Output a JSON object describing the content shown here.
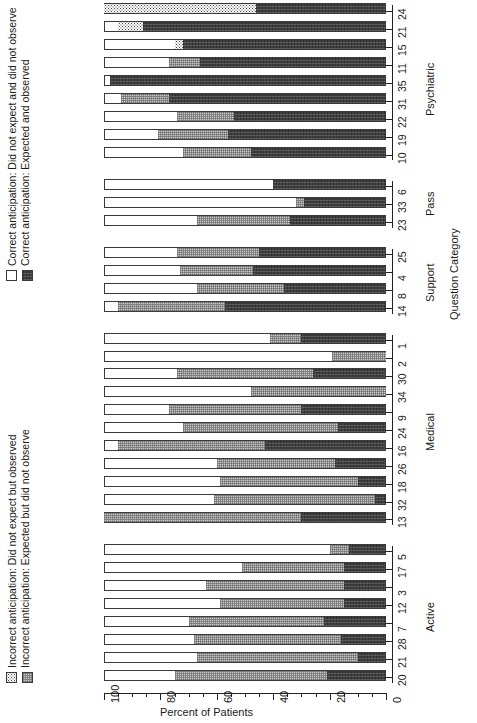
{
  "chart_data": {
    "type": "bar",
    "orientation": "stacked-horizontal-rotated",
    "title": "",
    "xlabel": "Question Category",
    "ylabel": "Percent of Patients",
    "ylim": [
      0,
      100
    ],
    "ytick_labels": [
      "0",
      "20",
      "40",
      "60",
      "80",
      "100"
    ],
    "ytick_values": [
      0,
      20,
      40,
      60,
      80,
      100
    ],
    "grid": false,
    "legend_position": "left",
    "series": [
      {
        "name": "Correct anticipation: Did not expect and did not observe",
        "key": "cdnd",
        "pattern": "open-white"
      },
      {
        "name": "Correct anticipation: Expected and observed",
        "key": "ceo",
        "pattern": "solid-dark"
      },
      {
        "name": "Incorrect anticipation: Did not expect but observed",
        "key": "indo",
        "pattern": "speckled"
      },
      {
        "name": "Incorrect anticipation: Expected but did not observe",
        "key": "iedn",
        "pattern": "gray-hatch"
      }
    ],
    "groups": [
      {
        "name": "Active",
        "questions": [
          {
            "q": "20",
            "cdnd": 25.0,
            "iedn": 54.0,
            "ceo": 21.0,
            "indo": 0.0
          },
          {
            "q": "21",
            "cdnd": 33.0,
            "iedn": 57.0,
            "ceo": 10.0,
            "indo": 0.0
          },
          {
            "q": "28",
            "cdnd": 32.0,
            "iedn": 52.0,
            "ceo": 16.0,
            "indo": 0.0
          },
          {
            "q": "7",
            "cdnd": 30.0,
            "iedn": 48.0,
            "ceo": 22.0,
            "indo": 0.0
          },
          {
            "q": "12",
            "cdnd": 41.0,
            "iedn": 44.0,
            "ceo": 15.0,
            "indo": 0.0
          },
          {
            "q": "3",
            "cdnd": 36.0,
            "iedn": 49.0,
            "ceo": 15.0,
            "indo": 0.0
          },
          {
            "q": "17",
            "cdnd": 49.0,
            "iedn": 36.0,
            "ceo": 15.0,
            "indo": 0.0
          },
          {
            "q": "5",
            "cdnd": 80.0,
            "iedn": 7.0,
            "ceo": 13.0,
            "indo": 0.0
          }
        ]
      },
      {
        "name": "Medical",
        "questions": [
          {
            "q": "13",
            "cdnd": 0.0,
            "iedn": 70.0,
            "ceo": 30.0,
            "indo": 0.0
          },
          {
            "q": "32",
            "cdnd": 39.0,
            "iedn": 57.0,
            "ceo": 4.0,
            "indo": 0.0
          },
          {
            "q": "18",
            "cdnd": 41.0,
            "iedn": 49.0,
            "ceo": 10.0,
            "indo": 0.0
          },
          {
            "q": "26",
            "cdnd": 40.0,
            "iedn": 42.0,
            "ceo": 18.0,
            "indo": 0.0
          },
          {
            "q": "16",
            "cdnd": 5.0,
            "iedn": 52.0,
            "ceo": 43.0,
            "indo": 0.0
          },
          {
            "q": "24",
            "cdnd": 28.0,
            "iedn": 55.0,
            "ceo": 17.0,
            "indo": 0.0
          },
          {
            "q": "9",
            "cdnd": 23.0,
            "iedn": 47.0,
            "ceo": 30.0,
            "indo": 0.0
          },
          {
            "q": "34",
            "cdnd": 52.0,
            "iedn": 48.0,
            "ceo": 0.0,
            "indo": 0.0
          },
          {
            "q": "30",
            "cdnd": 26.0,
            "iedn": 48.0,
            "ceo": 26.0,
            "indo": 0.0
          },
          {
            "q": "2",
            "cdnd": 81.0,
            "iedn": 19.0,
            "ceo": 0.0,
            "indo": 0.0
          },
          {
            "q": "1",
            "cdnd": 59.0,
            "iedn": 11.0,
            "ceo": 30.0,
            "indo": 0.0
          }
        ]
      },
      {
        "name": "Support",
        "questions": [
          {
            "q": "14",
            "cdnd": 5.0,
            "iedn": 38.0,
            "ceo": 57.0,
            "indo": 0.0
          },
          {
            "q": "8",
            "cdnd": 33.0,
            "iedn": 31.0,
            "ceo": 36.0,
            "indo": 0.0
          },
          {
            "q": "4",
            "cdnd": 27.0,
            "iedn": 26.0,
            "ceo": 47.0,
            "indo": 0.0
          },
          {
            "q": "25",
            "cdnd": 26.0,
            "iedn": 29.0,
            "ceo": 45.0,
            "indo": 0.0
          }
        ]
      },
      {
        "name": "Pass",
        "questions": [
          {
            "q": "23",
            "cdnd": 33.0,
            "iedn": 33.0,
            "ceo": 34.0,
            "indo": 0.0
          },
          {
            "q": "33",
            "cdnd": 68.0,
            "iedn": 3.0,
            "ceo": 29.0,
            "indo": 0.0
          },
          {
            "q": "6",
            "cdnd": 60.0,
            "iedn": 0.0,
            "ceo": 40.0,
            "indo": 0.0
          }
        ]
      },
      {
        "name": "Psychiatric",
        "questions": [
          {
            "q": "10",
            "cdnd": 28.0,
            "iedn": 24.0,
            "ceo": 48.0,
            "indo": 0.0
          },
          {
            "q": "19",
            "cdnd": 19.0,
            "iedn": 25.0,
            "ceo": 56.0,
            "indo": 0.0
          },
          {
            "q": "22",
            "cdnd": 26.0,
            "iedn": 20.0,
            "ceo": 54.0,
            "indo": 0.0
          },
          {
            "q": "31",
            "cdnd": 6.0,
            "iedn": 17.0,
            "ceo": 77.0,
            "indo": 0.0
          },
          {
            "q": "35",
            "cdnd": 2.0,
            "iedn": 0.0,
            "ceo": 98.0,
            "indo": 0.0
          },
          {
            "q": "11",
            "cdnd": 23.0,
            "iedn": 11.0,
            "ceo": 66.0,
            "indo": 0.0
          },
          {
            "q": "15",
            "cdnd": 25.0,
            "iedn": 0.0,
            "ceo": 72.0,
            "indo": 3.0
          },
          {
            "q": "21b",
            "cdnd": 5.0,
            "iedn": 0.0,
            "ceo": 86.0,
            "indo": 9.0
          },
          {
            "q": "24b",
            "cdnd": 0.0,
            "iedn": 0.0,
            "ceo": 46.0,
            "indo": 54.0
          }
        ]
      }
    ]
  },
  "axis": {
    "y_title": "Percent of Patients",
    "x_title": "Question Category",
    "ticks": [
      "100",
      "80",
      "60",
      "40",
      "20",
      "0"
    ]
  },
  "legend": {
    "entries": [
      {
        "label": "Correct anticipation: Did not expect and did not observe",
        "swatch": "open-white"
      },
      {
        "label": "Correct anticipation: Expected and observed",
        "swatch": "solid-dark"
      },
      {
        "label": "Incorrect anticipation: Did not expect but observed",
        "swatch": "speckled"
      },
      {
        "label": "Incorrect anticipation: Expected but did not observe",
        "swatch": "gray-hatch"
      }
    ]
  }
}
